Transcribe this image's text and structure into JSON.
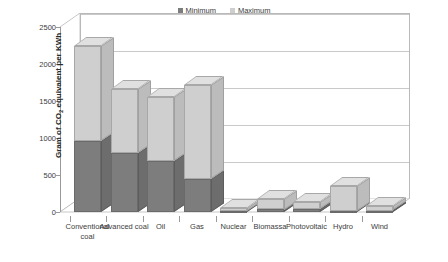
{
  "chart_data": {
    "type": "bar",
    "stacked": true,
    "title": "",
    "xlabel": "",
    "ylabel": "Gram of CO2 equivalent per KWh",
    "ylabel_prefix": "Gram of CO",
    "ylabel_sub": "2",
    "ylabel_suffix": " equivalent per KWh",
    "ylim": [
      0,
      2500
    ],
    "yticks": [
      0,
      500,
      1000,
      1500,
      2000,
      2500
    ],
    "ytick_labels": [
      "0",
      "500",
      "1000",
      "1500",
      "2000",
      "2500"
    ],
    "grid": true,
    "legend_position": "top-center",
    "categories": [
      "Conventional coal",
      "Advanced coal",
      "Oil",
      "Gas",
      "Nuclear",
      "Biomassa",
      "Photovoltaic",
      "Hydro",
      "Wind"
    ],
    "series": [
      {
        "name": "Minimum",
        "color": "#7d7d7d",
        "values": [
          960,
          800,
          690,
          440,
          20,
          35,
          40,
          15,
          20
        ]
      },
      {
        "name": "Maximum",
        "color": "#cfcfcf",
        "values": [
          2250,
          1660,
          1560,
          1710,
          60,
          180,
          140,
          350,
          80
        ]
      }
    ]
  },
  "legend": {
    "entries": [
      {
        "label": "Minimum",
        "color": "#7d7d7d"
      },
      {
        "label": "Maximum",
        "color": "#cfcfcf"
      }
    ]
  }
}
